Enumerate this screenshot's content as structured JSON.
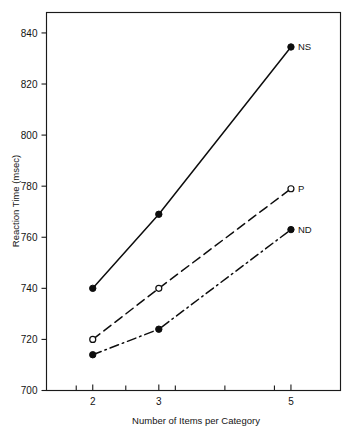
{
  "figure": {
    "ghost_caption": "",
    "background": "#ffffff",
    "ink": "#0d0d0d"
  },
  "chart_data": {
    "type": "line",
    "title": "",
    "xlabel": "Number of Items per Category",
    "ylabel": "Reaction Time (msec)",
    "x": [
      2,
      3,
      5
    ],
    "categories": [
      "2",
      "3",
      "5"
    ],
    "xtick_labels": [
      "2",
      "3",
      "5"
    ],
    "ytick_labels": [
      "700",
      "720",
      "740",
      "760",
      "780",
      "800",
      "820",
      "840"
    ],
    "ytick_values": [
      700,
      720,
      740,
      760,
      780,
      800,
      820,
      840
    ],
    "ylim": [
      700,
      848
    ],
    "xlim": [
      1.3,
      5.75
    ],
    "grid": false,
    "legend_position": "inline-right-of-last-point",
    "series": [
      {
        "name": "NS",
        "label": "NS",
        "values": [
          740,
          769,
          834.5
        ],
        "linestyle": "solid",
        "marker": "filled-circle",
        "color": "#0d0d0d"
      },
      {
        "name": "P",
        "label": "P",
        "values": [
          720,
          740,
          779
        ],
        "linestyle": "dashed",
        "marker": "open-circle",
        "color": "#0d0d0d"
      },
      {
        "name": "ND",
        "label": "ND",
        "values": [
          714,
          724,
          763
        ],
        "linestyle": "dash-dot",
        "marker": "filled-circle",
        "color": "#0d0d0d"
      }
    ],
    "minor_xticks": [
      1.75,
      2.5,
      3.25,
      4.0,
      4.75
    ]
  }
}
